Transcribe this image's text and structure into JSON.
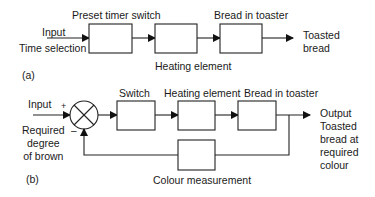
{
  "diagram_a": {
    "panel_label": "(a)",
    "input_label": "Input",
    "time_label": "Time selection",
    "blocks": [
      {
        "id": "timer",
        "label": "Preset timer switch"
      },
      {
        "id": "heating",
        "label": "Heating element"
      },
      {
        "id": "bread",
        "label": "Bread in toaster"
      }
    ],
    "output_label": "Toasted\nbread"
  },
  "diagram_b": {
    "panel_label": "(b)",
    "input_label": "Input",
    "plus_sign": "+",
    "minus_sign": "–",
    "required_label": "Required\ndegree\nof brown",
    "blocks": [
      {
        "id": "switch",
        "label": "Switch"
      },
      {
        "id": "heating",
        "label": "Heating element"
      },
      {
        "id": "bread",
        "label": "Bread in toaster"
      },
      {
        "id": "colour",
        "label": "Colour measurement"
      }
    ],
    "output_label": "Output\nToasted\nbread at\nrequired\ncolour"
  },
  "colors": {
    "line": "#222222",
    "background": "#ffffff"
  }
}
